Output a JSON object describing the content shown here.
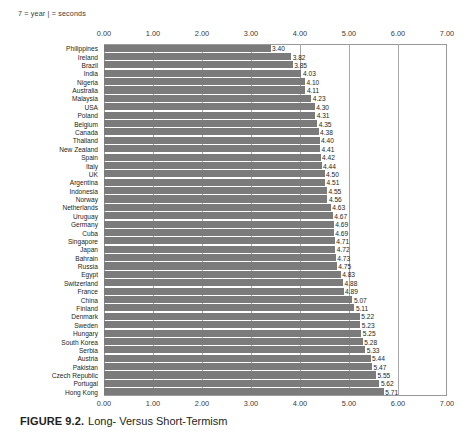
{
  "legend_note": "7 = year   | = seconds",
  "caption": {
    "number": "FIGURE 9.2.",
    "title": "Long- Versus Short-Termism"
  },
  "colors": {
    "bar": "#7b7b7b",
    "grid": "#a8a8a8",
    "frame": "#9a9a9a",
    "text": "#231f20",
    "background": "#ffffff"
  },
  "chart_data": {
    "type": "bar",
    "orientation": "horizontal",
    "title": "Long- Versus Short-Termism",
    "xlabel": "",
    "ylabel": "",
    "xlim": [
      0.0,
      7.0
    ],
    "xticks": [
      "0.00",
      "1.00",
      "2.00",
      "3.00",
      "4.00",
      "5.00",
      "6.00",
      "7.00"
    ],
    "xtick_values": [
      0,
      1,
      2,
      3,
      4,
      5,
      6,
      7
    ],
    "grid": true,
    "axis_positions": [
      "top",
      "bottom"
    ],
    "legend": null,
    "categories": [
      "Philippines",
      "Ireland",
      "Brazil",
      "India",
      "Nigeria",
      "Australia",
      "Malaysia",
      "USA",
      "Poland",
      "Belgium",
      "Canada",
      "Thailand",
      "New Zealand",
      "Spain",
      "Italy",
      "UK",
      "Argentina",
      "Indonesia",
      "Norway",
      "Netherlands",
      "Uruguay",
      "Germany",
      "Cuba",
      "Singapore",
      "Japan",
      "Bahrain",
      "Russia",
      "Egypt",
      "Switzerland",
      "France",
      "China",
      "Finland",
      "Denmark",
      "Sweden",
      "Hungary",
      "South Korea",
      "Serbia",
      "Austria",
      "Pakistan",
      "Czech Republic",
      "Portugal",
      "Hong Kong"
    ],
    "values": [
      3.4,
      3.82,
      3.85,
      4.03,
      4.1,
      4.11,
      4.23,
      4.3,
      4.31,
      4.35,
      4.38,
      4.4,
      4.41,
      4.42,
      4.44,
      4.5,
      4.51,
      4.55,
      4.56,
      4.63,
      4.67,
      4.69,
      4.69,
      4.71,
      4.72,
      4.73,
      4.75,
      4.83,
      4.88,
      4.89,
      5.07,
      5.11,
      5.22,
      5.23,
      5.25,
      5.28,
      5.33,
      5.44,
      5.47,
      5.55,
      5.62,
      5.71
    ],
    "value_labels": [
      "3.40",
      "3.82",
      "3.85",
      "4.03",
      "4.10",
      "4.11",
      "4.23",
      "4.30",
      "4.31",
      "4.35",
      "4.38",
      "4.40",
      "4.41",
      "4.42",
      "4.44",
      "4.50",
      "4.51",
      "4.55",
      "4.56",
      "4.63",
      "4.67",
      "4.69",
      "4.69",
      "4.71",
      "4.72",
      "4.73",
      "4.75",
      "4.83",
      "4.88",
      "4.89",
      "5.07",
      "5.11",
      "5.22",
      "5.23",
      "5.25",
      "5.28",
      "5.33",
      "5.44",
      "5.47",
      "5.55",
      "5.62",
      "5.71"
    ]
  }
}
